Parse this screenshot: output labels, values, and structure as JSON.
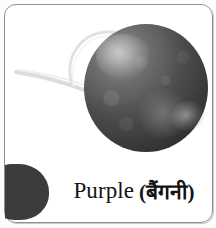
{
  "card": {
    "title": "Purple colour flashcard",
    "border_color": "#8f8f8f",
    "background_color": "#ffffff"
  },
  "photo": {
    "subject_label": "purple turnip",
    "icon": "turnip-photo",
    "bulb_color": "#3a3a3a",
    "highlight_color": "#9a9a9a",
    "tendril_color": "#d8d8d8"
  },
  "caption": {
    "english": "Purple",
    "hindi": "(बैंगनी)",
    "text_color": "#141414"
  },
  "swatch": {
    "name": "purple-color-swatch",
    "color": "#3c3c3c"
  }
}
